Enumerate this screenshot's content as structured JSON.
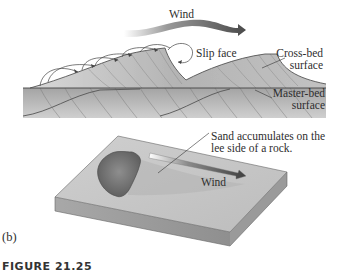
{
  "panel_a": {
    "wind_label": "Wind",
    "slip_face_label": "Slip face",
    "cross_bed_label_line1": "Cross-bed",
    "cross_bed_label_line2": "surface",
    "master_bed_label_line1": "Master-bed",
    "master_bed_label_line2": "surface"
  },
  "panel_b": {
    "annotation_line1": "Sand accumulates on the",
    "annotation_line2": "lee side of a rock.",
    "wind_label": "Wind",
    "panel_label": "(b)"
  },
  "caption": {
    "figure_number": "FIGURE 21.25",
    "text": "(a) Cross-bedding and (b) sand accumulation"
  },
  "colors": {
    "sand_light": "#c9c9c9",
    "sand_mid": "#a9a9a9",
    "sand_dark": "#8a8a8a",
    "rock": "#7a7a7a",
    "arrow": "#555555",
    "background": "#ffffff"
  }
}
